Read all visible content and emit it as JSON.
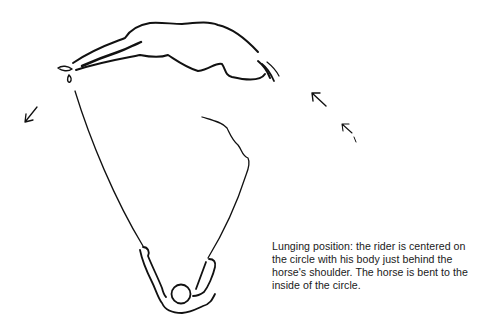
{
  "illustration": {
    "subject": "lunging-position-diagram",
    "elements": [
      "horse",
      "rider",
      "lunge-line",
      "direction-arrows"
    ]
  },
  "caption": {
    "lines": [
      "Lunging position: the rider is centered on",
      "the circle with his body just behind the",
      "horse's shoulder. The horse is bent to the",
      "inside of the circle."
    ]
  },
  "colors": {
    "ink": "#111111",
    "background": "#ffffff"
  }
}
